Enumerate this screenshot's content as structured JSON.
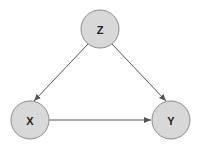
{
  "diagram": {
    "type": "directed-graph",
    "nodes": [
      {
        "id": "Z",
        "label": "Z",
        "cx": 100,
        "cy": 29,
        "r": 19
      },
      {
        "id": "X",
        "label": "X",
        "cx": 30,
        "cy": 120,
        "r": 19
      },
      {
        "id": "Y",
        "label": "Y",
        "cx": 171,
        "cy": 120,
        "r": 19
      }
    ],
    "edges": [
      {
        "from": "Z",
        "to": "X"
      },
      {
        "from": "Z",
        "to": "Y"
      },
      {
        "from": "X",
        "to": "Y"
      }
    ],
    "colors": {
      "node_fill": "#d8d8d8",
      "node_stroke": "#8a8a8a",
      "edge": "#555555",
      "label": "#222222"
    }
  }
}
